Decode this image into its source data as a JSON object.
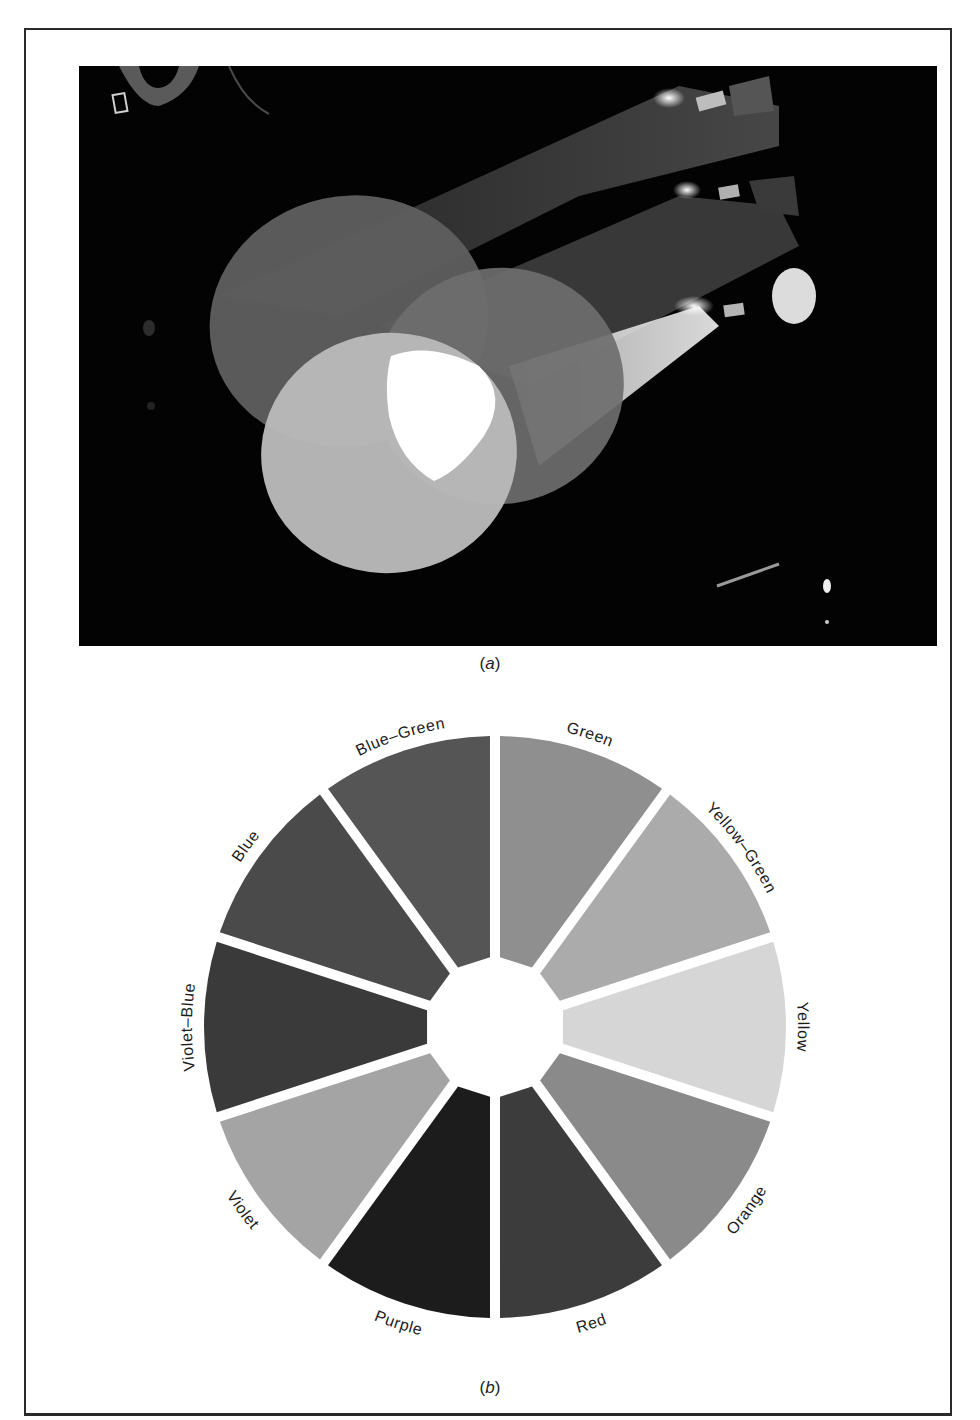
{
  "figure": {
    "panel_a": {
      "caption_open": "(",
      "caption_letter": "a",
      "caption_close": ")",
      "description": "Photograph of three stage spotlights projecting overlapping circles of light"
    },
    "panel_b": {
      "caption_open": "(",
      "caption_letter": "b",
      "caption_close": ")",
      "description": "Color wheel with twelve segments"
    }
  },
  "color_wheel": {
    "segments": [
      {
        "label": "Green",
        "shade": "#8f8f8f"
      },
      {
        "label": "Yellow–Green",
        "shade": "#ababab"
      },
      {
        "label": "Yellow",
        "shade": "#d6d6d6"
      },
      {
        "label": "Orange",
        "shade": "#8a8a8a"
      },
      {
        "label": "Red",
        "shade": "#3c3c3c"
      },
      {
        "label": "Purple",
        "shade": "#1c1c1c"
      },
      {
        "label": "Violet",
        "shade": "#a4a4a4"
      },
      {
        "label": "Violet–Blue",
        "shade": "#3a3a3a"
      },
      {
        "label": "Blue",
        "shade": "#4a4a4a"
      },
      {
        "label": "Blue–Green",
        "shade": "#555555"
      }
    ]
  },
  "colors": {
    "frame": "#2a2a2a",
    "photo_background": "#030303",
    "page": "#ffffff"
  }
}
